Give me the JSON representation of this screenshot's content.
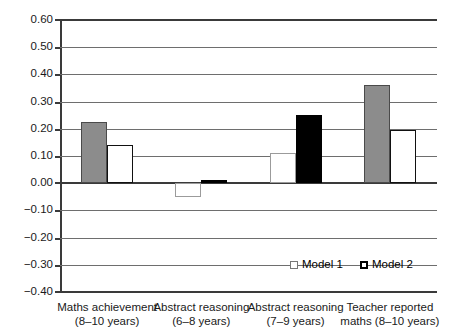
{
  "chart_data": {
    "type": "bar",
    "title": "",
    "subtitle": "",
    "xlabel": "",
    "ylabel": "",
    "ylim": [
      -0.4,
      0.6
    ],
    "ytick_step": 0.1,
    "grid": true,
    "legend_position": "bottom-right",
    "categories": [
      {
        "line1": "Maths achievement",
        "line2": "(8–10 years)"
      },
      {
        "line1": "Abstract reasoning",
        "line2": "(6–8 years)"
      },
      {
        "line1": "Abstract reasoning",
        "line2": "(7–9 years)"
      },
      {
        "line1": "Teacher reported",
        "line2": "maths (8–10 years)"
      }
    ],
    "ytick_labels": [
      "0.60",
      "0.50",
      "0.40",
      "0.30",
      "0.20",
      "0.10",
      "0.00",
      "−0.10",
      "−0.20",
      "−0.30",
      "−0.40"
    ],
    "ytick_values": [
      0.6,
      0.5,
      0.4,
      0.3,
      0.2,
      0.1,
      0.0,
      -0.1,
      -0.2,
      -0.3,
      -0.4
    ],
    "series": [
      {
        "name": "Model 1",
        "values": [
          0.225,
          -0.05,
          0.11,
          0.36
        ],
        "styles": [
          "series-gray",
          "series-outline-light",
          "series-outline-light",
          "series-gray"
        ]
      },
      {
        "name": "Model 2",
        "values": [
          0.14,
          0.012,
          0.25,
          0.195
        ],
        "styles": [
          "series-white",
          "series-black",
          "series-black",
          "series-white"
        ]
      }
    ],
    "colors": {
      "gray_fill": "#8c8c8c",
      "black_fill": "#000000",
      "white_fill": "#ffffff",
      "axis": "#3a3a3a",
      "gridline": "#6e6e6e"
    }
  },
  "legend": {
    "entries": [
      {
        "label": "Model 1",
        "swatch": "sw-model1"
      },
      {
        "label": "Model 2",
        "swatch": "sw-model2"
      }
    ]
  }
}
